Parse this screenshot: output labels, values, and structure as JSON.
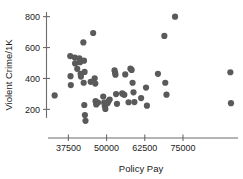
{
  "chart_data": {
    "type": "scatter",
    "title": "",
    "xlabel": "Policy Pay",
    "ylabel": "Violent Crime/1K",
    "xlim": [
      30500,
      93000
    ],
    "ylim": [
      100,
      830
    ],
    "xticks": [
      37500,
      50000,
      62500,
      75000
    ],
    "yticks": [
      200,
      400,
      600,
      800
    ],
    "xtick_labels": [
      "37500",
      "50000",
      "62500",
      "75000"
    ],
    "ytick_labels": [
      "200",
      "400",
      "600",
      "800"
    ],
    "grid": false,
    "legend": false,
    "marker_color": "#5a5a5a",
    "marker_size": 3.1,
    "points": [
      {
        "x": 33000,
        "y": 290
      },
      {
        "x": 38100,
        "y": 545
      },
      {
        "x": 38200,
        "y": 415
      },
      {
        "x": 38300,
        "y": 357
      },
      {
        "x": 39600,
        "y": 535
      },
      {
        "x": 39700,
        "y": 497
      },
      {
        "x": 40400,
        "y": 462
      },
      {
        "x": 41100,
        "y": 530
      },
      {
        "x": 41300,
        "y": 505
      },
      {
        "x": 41500,
        "y": 430
      },
      {
        "x": 41600,
        "y": 412
      },
      {
        "x": 42400,
        "y": 633
      },
      {
        "x": 42600,
        "y": 515
      },
      {
        "x": 42800,
        "y": 442
      },
      {
        "x": 42500,
        "y": 372
      },
      {
        "x": 42700,
        "y": 228
      },
      {
        "x": 42900,
        "y": 163
      },
      {
        "x": 43100,
        "y": 126
      },
      {
        "x": 44800,
        "y": 378
      },
      {
        "x": 45600,
        "y": 694
      },
      {
        "x": 46100,
        "y": 401
      },
      {
        "x": 46300,
        "y": 367
      },
      {
        "x": 46400,
        "y": 253
      },
      {
        "x": 46600,
        "y": 232
      },
      {
        "x": 47200,
        "y": 244
      },
      {
        "x": 48900,
        "y": 283
      },
      {
        "x": 49200,
        "y": 243
      },
      {
        "x": 49400,
        "y": 222
      },
      {
        "x": 49600,
        "y": 203
      },
      {
        "x": 50300,
        "y": 240
      },
      {
        "x": 50600,
        "y": 252
      },
      {
        "x": 51000,
        "y": 263
      },
      {
        "x": 52600,
        "y": 452
      },
      {
        "x": 52800,
        "y": 436
      },
      {
        "x": 52900,
        "y": 424
      },
      {
        "x": 53100,
        "y": 299
      },
      {
        "x": 53400,
        "y": 236
      },
      {
        "x": 55100,
        "y": 303
      },
      {
        "x": 55400,
        "y": 299
      },
      {
        "x": 55800,
        "y": 294
      },
      {
        "x": 56100,
        "y": 426
      },
      {
        "x": 57200,
        "y": 246
      },
      {
        "x": 57800,
        "y": 463
      },
      {
        "x": 58200,
        "y": 455
      },
      {
        "x": 58500,
        "y": 372
      },
      {
        "x": 58800,
        "y": 310
      },
      {
        "x": 59100,
        "y": 247
      },
      {
        "x": 61300,
        "y": 273
      },
      {
        "x": 62900,
        "y": 341
      },
      {
        "x": 63200,
        "y": 224
      },
      {
        "x": 66800,
        "y": 430
      },
      {
        "x": 68900,
        "y": 675
      },
      {
        "x": 69200,
        "y": 372
      },
      {
        "x": 69600,
        "y": 295
      },
      {
        "x": 72400,
        "y": 800
      },
      {
        "x": 90500,
        "y": 440
      },
      {
        "x": 90700,
        "y": 240
      }
    ]
  }
}
